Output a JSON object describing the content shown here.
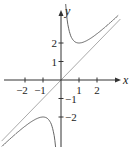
{
  "chart_data": {
    "type": "line",
    "title": "",
    "xlabel": "x",
    "ylabel": "y",
    "xlim": [
      -3.3,
      3.3
    ],
    "ylim": [
      -3.5,
      4.3
    ],
    "grid": false,
    "legend": null,
    "x_ticks": [
      -2,
      -1,
      1,
      2
    ],
    "x_tick_labels": [
      "−2",
      "−1",
      "1",
      "2"
    ],
    "y_ticks": [
      -2,
      -1,
      1,
      2
    ],
    "y_tick_labels": [
      "−2",
      "−1",
      "1",
      "2"
    ],
    "series": [
      {
        "name": "curve y = x + 1/x (right branch)",
        "x": [
          0.25,
          0.35,
          0.5,
          0.75,
          1,
          1.5,
          2,
          2.5,
          3
        ],
        "y": [
          4.25,
          3.21,
          2.5,
          2.08,
          2,
          2.17,
          2.5,
          2.9,
          3.33
        ],
        "color": "#666666"
      },
      {
        "name": "curve y = x + 1/x (left branch)",
        "x": [
          -3,
          -2.5,
          -2,
          -1.5,
          -1,
          -0.75,
          -0.5,
          -0.35,
          -0.25
        ],
        "y": [
          -3.33,
          -2.9,
          -2.5,
          -2.17,
          -2,
          -2.08,
          -2.5,
          -3.21,
          -4.25
        ],
        "color": "#666666"
      },
      {
        "name": "asymptote y = x",
        "x": [
          -3.3,
          3.3
        ],
        "y": [
          -3.3,
          3.3
        ],
        "color": "#aaaaaa"
      }
    ]
  },
  "axes": {
    "x_label": "x",
    "y_label": "y"
  }
}
